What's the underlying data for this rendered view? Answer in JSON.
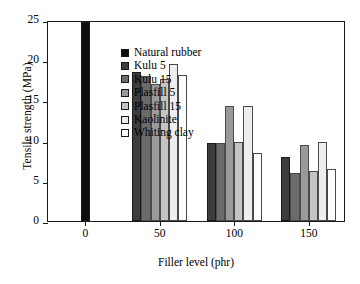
{
  "chart_data": {
    "type": "bar",
    "title": "",
    "xlabel": "Filler level (phr)",
    "ylabel": "Tensile strength (MPa)",
    "categories": [
      "0",
      "50",
      "100",
      "150"
    ],
    "xticks": [
      0,
      50,
      100,
      150
    ],
    "xlim": [
      -25,
      175
    ],
    "ylim": [
      0,
      25
    ],
    "yticks": [
      0,
      5,
      10,
      15,
      20,
      25
    ],
    "ytick_labels": [
      "0",
      "5",
      "10",
      "15",
      "20",
      "25"
    ],
    "grid": false,
    "legend_position": "upper-left-inside",
    "series": [
      {
        "name": "Natural rubber",
        "color": "#0d0d0d",
        "values": [
          24.8,
          null,
          null,
          null
        ]
      },
      {
        "name": "Kulu 5",
        "color": "#3d3d3d",
        "values": [
          null,
          18.5,
          9.7,
          8.0
        ]
      },
      {
        "name": "Kulu 15",
        "color": "#6b6b6b",
        "values": [
          null,
          18.0,
          9.7,
          6.0
        ]
      },
      {
        "name": "Plasfill 5",
        "color": "#9a9a9a",
        "values": [
          null,
          17.1,
          14.3,
          9.5
        ]
      },
      {
        "name": "Plasfill 15",
        "color": "#c4c4c4",
        "values": [
          null,
          17.7,
          9.8,
          6.2
        ]
      },
      {
        "name": "Kaolinite",
        "color": "#eeeeee",
        "values": [
          null,
          19.5,
          14.3,
          9.8
        ]
      },
      {
        "name": "Whiting clay",
        "color": "#ffffff",
        "values": [
          null,
          18.1,
          8.4,
          6.5
        ]
      }
    ]
  },
  "legend": {
    "items": [
      {
        "label": "Natural rubber",
        "color": "#0d0d0d"
      },
      {
        "label": "Kulu 5",
        "color": "#3d3d3d"
      },
      {
        "label": "Kulu 15",
        "color": "#6b6b6b"
      },
      {
        "label": "Plasfill 5",
        "color": "#9a9a9a"
      },
      {
        "label": "Plasfill 15",
        "color": "#c4c4c4"
      },
      {
        "label": "Kaolinite",
        "color": "#eeeeee"
      },
      {
        "label": "Whiting clay",
        "color": "#ffffff"
      }
    ]
  },
  "axes": {
    "y_title": "Tensile strength (MPa)",
    "x_title": "Filler level (phr)"
  }
}
